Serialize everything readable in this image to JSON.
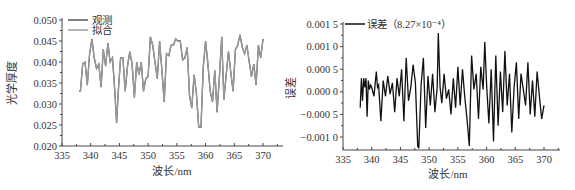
{
  "chart_data": [
    {
      "type": "line",
      "title": "",
      "xlabel": "波长/nm",
      "ylabel": "光学厚度",
      "xlim": [
        335,
        373
      ],
      "ylim": [
        0.02,
        0.05
      ],
      "xticks": [
        335,
        340,
        345,
        350,
        355,
        360,
        365,
        370
      ],
      "yticks": [
        0.02,
        0.025,
        0.03,
        0.035,
        0.04,
        0.045,
        0.05
      ],
      "ytick_labels": [
        "0.020",
        "0.025",
        "0.030",
        "0.035",
        "0.040",
        "0.045",
        "0.050"
      ],
      "grid": false,
      "legend_position": "top-left",
      "series": [
        {
          "name": "观测",
          "color": "#555555",
          "x": [
            338.0,
            338.2,
            338.6,
            339.0,
            339.4,
            339.8,
            340.2,
            340.6,
            341.0,
            341.4,
            341.8,
            342.2,
            342.6,
            343.0,
            343.4,
            343.8,
            344.2,
            344.5,
            344.8,
            345.2,
            345.6,
            346.0,
            346.4,
            346.8,
            347.2,
            347.6,
            348.0,
            348.4,
            348.8,
            349.2,
            349.6,
            350.0,
            350.4,
            350.8,
            351.2,
            351.6,
            352.0,
            352.4,
            352.8,
            353.2,
            353.6,
            354.0,
            354.4,
            354.8,
            355.2,
            355.6,
            356.0,
            356.4,
            356.8,
            357.2,
            357.6,
            358.0,
            358.4,
            358.8,
            359.2,
            359.6,
            360.0,
            360.4,
            360.8,
            361.2,
            361.6,
            362.0,
            362.4,
            362.8,
            363.2,
            363.6,
            364.0,
            364.4,
            364.8,
            365.2,
            365.6,
            366.0,
            366.4,
            366.8,
            367.2,
            367.6,
            368.0,
            368.4,
            368.8,
            369.2,
            369.6,
            370.0
          ],
          "values": [
            0.033,
            0.033,
            0.0395,
            0.04,
            0.0345,
            0.042,
            0.0455,
            0.041,
            0.0385,
            0.0395,
            0.034,
            0.043,
            0.039,
            0.0445,
            0.04,
            0.041,
            0.033,
            0.0255,
            0.033,
            0.041,
            0.041,
            0.033,
            0.039,
            0.0425,
            0.0395,
            0.0315,
            0.04,
            0.037,
            0.04,
            0.033,
            0.036,
            0.0365,
            0.046,
            0.044,
            0.04,
            0.036,
            0.045,
            0.038,
            0.0305,
            0.042,
            0.0415,
            0.044,
            0.044,
            0.0455,
            0.045,
            0.045,
            0.0405,
            0.041,
            0.0435,
            0.032,
            0.029,
            0.037,
            0.0325,
            0.0245,
            0.0245,
            0.039,
            0.045,
            0.0395,
            0.033,
            0.0305,
            0.038,
            0.028,
            0.0365,
            0.046,
            0.031,
            0.037,
            0.0425,
            0.0375,
            0.033,
            0.043,
            0.044,
            0.0465,
            0.0435,
            0.042,
            0.044,
            0.04,
            0.0365,
            0.0395,
            0.0345,
            0.044,
            0.041,
            0.0455
          ]
        },
        {
          "name": "拟合",
          "color": "#9a9a9a",
          "x": [
            338.0,
            338.2,
            338.6,
            339.0,
            339.4,
            339.8,
            340.2,
            340.6,
            341.0,
            341.4,
            341.8,
            342.2,
            342.6,
            343.0,
            343.4,
            343.8,
            344.2,
            344.5,
            344.8,
            345.2,
            345.6,
            346.0,
            346.4,
            346.8,
            347.2,
            347.6,
            348.0,
            348.4,
            348.8,
            349.2,
            349.6,
            350.0,
            350.4,
            350.8,
            351.2,
            351.6,
            352.0,
            352.4,
            352.8,
            353.2,
            353.6,
            354.0,
            354.4,
            354.8,
            355.2,
            355.6,
            356.0,
            356.4,
            356.8,
            357.2,
            357.6,
            358.0,
            358.4,
            358.8,
            359.2,
            359.6,
            360.0,
            360.4,
            360.8,
            361.2,
            361.6,
            362.0,
            362.4,
            362.8,
            363.2,
            363.6,
            364.0,
            364.4,
            364.8,
            365.2,
            365.6,
            366.0,
            366.4,
            366.8,
            367.2,
            367.6,
            368.0,
            368.4,
            368.8,
            369.2,
            369.6,
            370.0
          ],
          "values": [
            0.0332,
            0.0331,
            0.0396,
            0.0399,
            0.0346,
            0.0419,
            0.0453,
            0.0411,
            0.0386,
            0.0394,
            0.0342,
            0.0429,
            0.0391,
            0.0443,
            0.0401,
            0.0409,
            0.0332,
            0.0257,
            0.0331,
            0.0409,
            0.0409,
            0.0331,
            0.0389,
            0.0424,
            0.0394,
            0.0317,
            0.0399,
            0.0371,
            0.0399,
            0.0331,
            0.0361,
            0.0366,
            0.0458,
            0.0441,
            0.0399,
            0.0361,
            0.0449,
            0.0381,
            0.0307,
            0.0419,
            0.0416,
            0.0439,
            0.0441,
            0.0454,
            0.0449,
            0.0449,
            0.0406,
            0.0409,
            0.0434,
            0.0321,
            0.0291,
            0.0369,
            0.0326,
            0.0247,
            0.0247,
            0.0389,
            0.0449,
            0.0396,
            0.0331,
            0.0306,
            0.0379,
            0.0282,
            0.0364,
            0.0458,
            0.0311,
            0.0369,
            0.0424,
            0.0376,
            0.0331,
            0.0429,
            0.0441,
            0.0463,
            0.0436,
            0.0421,
            0.0439,
            0.0401,
            0.0366,
            0.0394,
            0.0346,
            0.0439,
            0.0411,
            0.0453
          ]
        }
      ]
    },
    {
      "type": "line",
      "title": "",
      "xlabel": "波长/nm",
      "ylabel": "误差",
      "xlim": [
        335,
        373
      ],
      "ylim": [
        -0.00125,
        0.0015
      ],
      "xticks": [
        335,
        340,
        345,
        350,
        355,
        360,
        365,
        370
      ],
      "yticks": [
        -0.001,
        -0.0005,
        0.0,
        0.0005,
        0.001,
        0.0015
      ],
      "ytick_labels": [
        "−0.001 0",
        "−0.000 5",
        "0.000 0",
        "0.000 5",
        "0.001 0",
        "0.001 5"
      ],
      "grid": false,
      "legend_position": "top-left",
      "series": [
        {
          "name": "误差（8.27×10⁻⁴）",
          "color": "#111111",
          "x": [
            338.0,
            338.2,
            338.4,
            338.6,
            338.8,
            339.0,
            339.2,
            339.4,
            339.6,
            339.8,
            340.0,
            340.4,
            340.8,
            341.0,
            341.2,
            341.6,
            342.0,
            342.4,
            342.8,
            343.2,
            343.6,
            344.0,
            344.4,
            344.8,
            345.2,
            345.6,
            346.0,
            346.4,
            346.8,
            347.2,
            347.6,
            348.0,
            348.2,
            348.6,
            349.0,
            349.4,
            349.8,
            350.2,
            350.6,
            351.0,
            351.4,
            351.6,
            351.9,
            352.2,
            352.6,
            353.0,
            353.4,
            353.8,
            354.2,
            354.6,
            355.0,
            355.4,
            355.8,
            356.2,
            356.6,
            357.0,
            357.4,
            357.8,
            358.2,
            358.6,
            359.0,
            359.4,
            359.7,
            360.0,
            360.4,
            360.8,
            361.2,
            361.6,
            362.0,
            362.4,
            362.8,
            363.2,
            363.6,
            364.0,
            364.4,
            364.8,
            365.2,
            365.6,
            366.0,
            366.4,
            366.8,
            367.2,
            367.6,
            368.0,
            368.4,
            368.8,
            369.2,
            369.6,
            370.0
          ],
          "values": [
            -0.00035,
            0.0003,
            -0.0002,
            0.0003,
            0.0001,
            0.0003,
            -0.00055,
            0.00025,
            5e-05,
            0.00015,
            0.0001,
            -0.0001,
            0.00045,
            0.0001,
            0.00015,
            -0.00065,
            0.00025,
            -0.0001,
            0.00035,
            -5e-05,
            0.0002,
            -0.00045,
            0.0003,
            -0.0001,
            0.0005,
            -0.00065,
            0.00075,
            -0.0002,
            0.0001,
            0.0006,
            0.0002,
            -0.0012,
            -0.00125,
            0.00015,
            0.00075,
            -0.0008,
            0.00035,
            -0.0003,
            0.0004,
            -0.00045,
            0.0001,
            0.0013,
            0.0001,
            -0.00025,
            0.0004,
            -0.00015,
            5e-05,
            -0.0005,
            0.0003,
            -0.00035,
            0.00055,
            -0.0003,
            0.0005,
            -0.0001,
            -0.0006,
            -0.0012,
            0.0008,
            5e-05,
            0.0004,
            -0.0006,
            0.00055,
            5e-05,
            0.0011,
            0.00015,
            -0.0007,
            0.0005,
            -0.0011,
            0.0008,
            -0.00075,
            0.00045,
            -0.00045,
            0.0009,
            -0.0003,
            0.0004,
            -0.0009,
            0.0001,
            0.00065,
            -0.0006,
            0.0004,
            5e-05,
            -0.0003,
            0.00065,
            -0.0005,
            0.00025,
            -0.00055,
            0.00045,
            -0.0001,
            -0.0006,
            -0.0003
          ]
        }
      ]
    }
  ],
  "left": {
    "ylabel": "光学厚度",
    "xlabel": "波长/nm",
    "legend": [
      "观测",
      "拟合"
    ]
  },
  "right": {
    "ylabel": "误差",
    "xlabel": "波长/nm",
    "legend": [
      "误差（8.27×10⁻⁴）"
    ]
  }
}
